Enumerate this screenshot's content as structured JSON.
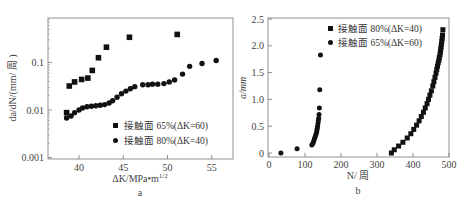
{
  "chart_data": [
    {
      "id": "a",
      "type": "scatter",
      "panel_label": "a",
      "xlabel": "ΔK/MPa•m^1/2",
      "xlabel_main": "ΔK/MPa•m",
      "xlabel_sup": "1/2",
      "ylabel": "da/dN/(mm/ 周 )",
      "xscale": "linear",
      "yscale": "log",
      "xlim": [
        36.8,
        58
      ],
      "ylim": [
        0.001,
        1
      ],
      "xticks": [
        40,
        45,
        50,
        55
      ],
      "yticks": [
        0.001,
        0.01,
        0.1
      ],
      "ytick_labels": [
        "0.001",
        "0.01",
        "0.1"
      ],
      "legend_position": "lower right",
      "series": [
        {
          "name": "接触面 65%(ΔK=60)",
          "marker": "square",
          "x": [
            38.6,
            38.9,
            39.5,
            40.3,
            41.0,
            41.5,
            42.2,
            43.1,
            45.7,
            51.1
          ],
          "y": [
            0.0088,
            0.032,
            0.039,
            0.044,
            0.047,
            0.068,
            0.126,
            0.21,
            0.34,
            0.39
          ]
        },
        {
          "name": "接触面 80%(ΔK=40)",
          "marker": "circle",
          "x": [
            38.6,
            39.1,
            39.5,
            40.0,
            40.4,
            40.9,
            41.4,
            41.9,
            42.4,
            42.9,
            43.4,
            43.8,
            44.3,
            44.8,
            45.3,
            45.8,
            46.3,
            47.2,
            47.8,
            48.3,
            48.9,
            49.6,
            50.2,
            50.8,
            51.7,
            52.5,
            53.9,
            55.5
          ],
          "y": [
            0.0068,
            0.0075,
            0.0088,
            0.01,
            0.011,
            0.0117,
            0.012,
            0.0123,
            0.0126,
            0.013,
            0.014,
            0.0157,
            0.0186,
            0.022,
            0.025,
            0.028,
            0.031,
            0.034,
            0.034,
            0.035,
            0.035,
            0.036,
            0.039,
            0.043,
            0.057,
            0.083,
            0.095,
            0.11
          ]
        }
      ]
    },
    {
      "id": "b",
      "type": "scatter",
      "panel_label": "b",
      "xlabel": "N/ 周",
      "ylabel": "a/mm",
      "xscale": "linear",
      "yscale": "linear",
      "xlim": [
        0,
        500
      ],
      "ylim": [
        -0.25,
        2.5
      ],
      "xticks": [
        0,
        100,
        200,
        300,
        400,
        500
      ],
      "yticks": [
        0,
        0.5,
        1.0,
        1.5,
        2.0,
        2.5
      ],
      "ytick_labels": [
        "0",
        "0.5",
        "1.0",
        "1.5",
        "2.0",
        "2.5"
      ],
      "legend_position": "upper right",
      "series": [
        {
          "name": "接触面 80%(ΔK=40)",
          "marker": "square",
          "x": [
            340,
            348,
            360,
            372,
            384,
            394,
            402,
            410,
            417,
            423,
            429,
            434,
            439,
            443,
            447,
            451,
            455,
            458,
            461,
            464,
            466,
            468,
            470,
            472,
            473,
            475,
            476,
            477,
            478,
            479,
            480,
            481,
            482,
            483
          ],
          "y": [
            0.0,
            0.06,
            0.13,
            0.2,
            0.28,
            0.36,
            0.44,
            0.52,
            0.6,
            0.68,
            0.76,
            0.84,
            0.92,
            1.0,
            1.08,
            1.16,
            1.25,
            1.33,
            1.41,
            1.49,
            1.56,
            1.62,
            1.68,
            1.73,
            1.78,
            1.83,
            1.88,
            1.93,
            1.98,
            2.03,
            2.08,
            2.14,
            2.2,
            2.3
          ]
        },
        {
          "name": "接触面 65%(ΔK=60)",
          "marker": "circle",
          "x": [
            33,
            78,
            119,
            122,
            124,
            126,
            128,
            130,
            132,
            133,
            134,
            135,
            136,
            137,
            138,
            139,
            140,
            141,
            143
          ],
          "y": [
            0.0,
            0.08,
            0.15,
            0.18,
            0.22,
            0.26,
            0.3,
            0.34,
            0.38,
            0.42,
            0.46,
            0.5,
            0.55,
            0.6,
            0.65,
            0.72,
            0.84,
            1.18,
            1.83
          ]
        }
      ]
    }
  ]
}
